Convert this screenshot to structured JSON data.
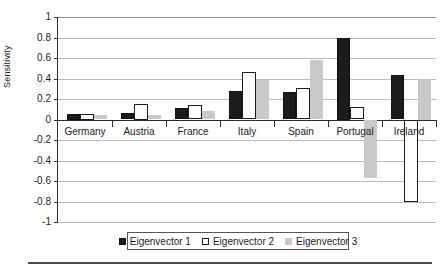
{
  "chart_data": {
    "type": "bar",
    "title": "",
    "xlabel": "",
    "ylabel": "Sensitivity",
    "ylim": [
      -1,
      1
    ],
    "yticks": [
      1,
      0.8,
      0.6,
      0.4,
      0.2,
      0,
      -0.2,
      -0.4,
      -0.6,
      -0.8,
      -1
    ],
    "ytick_labels": [
      "1",
      "0.8",
      "0.6",
      "0.4",
      "0.2",
      "0",
      "-0.2",
      "-0.4",
      "-0.6",
      "-0.8",
      "-1"
    ],
    "categories": [
      "Germany",
      "Austria",
      "France",
      "Italy",
      "Spain",
      "Portugal",
      "Ireland"
    ],
    "grid": true,
    "legend_position": "bottom",
    "series": [
      {
        "name": "Eigenvector 1",
        "color": "#1c1c1c",
        "values": [
          0.05,
          0.06,
          0.11,
          0.28,
          0.27,
          0.8,
          0.43
        ]
      },
      {
        "name": "Eigenvector 2",
        "color": "#ffffff",
        "values": [
          0.05,
          0.15,
          0.14,
          0.46,
          0.31,
          0.12,
          -0.8
        ]
      },
      {
        "name": "Eigenvector 3",
        "color": "#c9c9c9",
        "values": [
          0.04,
          0.04,
          0.08,
          0.39,
          0.58,
          -0.57,
          0.4
        ]
      }
    ]
  },
  "axis": {
    "y_title": "Sensitivity"
  }
}
